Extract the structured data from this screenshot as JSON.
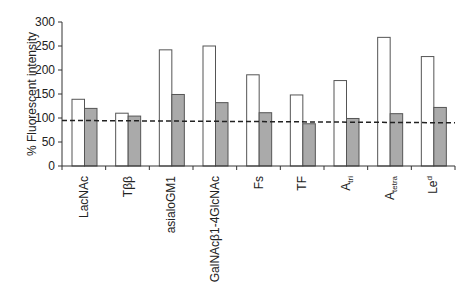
{
  "chart_data": {
    "type": "bar",
    "title": "",
    "xlabel": "",
    "ylabel": "% Fluorescent intensity",
    "ylim": [
      0,
      300
    ],
    "yticks": [
      0,
      50,
      100,
      150,
      200,
      250,
      300
    ],
    "grid": false,
    "legend": null,
    "categories": [
      "LacNAc",
      "Tββ",
      "asialoGM1",
      "GalNAcβ1-4GlcNAc",
      "Fs",
      "TF",
      "Atri",
      "Atetra",
      "Led"
    ],
    "category_labels": [
      {
        "base": "LacNAc",
        "sub": "",
        "sup": ""
      },
      {
        "base": "Tββ",
        "sub": "",
        "sup": ""
      },
      {
        "base": "asialoGM1",
        "sub": "",
        "sup": ""
      },
      {
        "base": "GalNAcβ1-4GlcNAc",
        "sub": "",
        "sup": ""
      },
      {
        "base": "Fs",
        "sub": "",
        "sup": ""
      },
      {
        "base": "TF",
        "sub": "",
        "sup": ""
      },
      {
        "base": "A",
        "sub": "tri",
        "sup": ""
      },
      {
        "base": "A",
        "sub": "tetra",
        "sup": ""
      },
      {
        "base": "Le",
        "sub": "",
        "sup": "d"
      }
    ],
    "series": [
      {
        "name": "white",
        "color": "#ffffff",
        "values": [
          139,
          110,
          242,
          250,
          190,
          148,
          178,
          268,
          228
        ]
      },
      {
        "name": "gray",
        "color": "#aaaaaa",
        "values": [
          120,
          104,
          149,
          132,
          111,
          88,
          99,
          109,
          122
        ]
      }
    ],
    "reference_line": {
      "style": "dashed",
      "y_start": 95,
      "y_end": 90
    }
  }
}
